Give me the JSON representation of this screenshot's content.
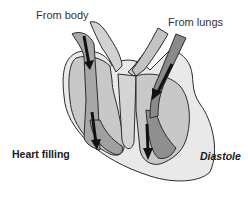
{
  "diagram": {
    "title": "Diastole",
    "subtitle": "Heart filling",
    "labels": {
      "from_body": "From body",
      "from_lungs": "From lungs",
      "heart_filling": "Heart filling",
      "diastole": "Diastole"
    },
    "colors": {
      "outer_wall": "#e9e9e9",
      "chamber_light": "#c8c8c8",
      "chamber_mid": "#b0b0b0",
      "blood_flow": "#8a8a8a",
      "outline": "#2b2b2b",
      "arrow": "#111111"
    }
  }
}
